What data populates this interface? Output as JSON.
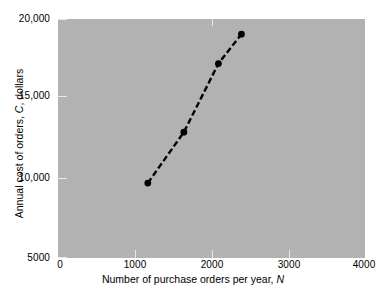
{
  "chart_data": {
    "type": "line",
    "title": "",
    "subtitle": "",
    "xlabel_prefix": "Number of purchase orders per year, ",
    "xlabel_symbol": "N",
    "ylabel_prefix": "Annual cost of orders, ",
    "ylabel_symbol": "C",
    "ylabel_suffix": ", dollars",
    "xlim": [
      0,
      4000
    ],
    "ylim": [
      5000,
      20000
    ],
    "xticks": [
      0,
      1000,
      2000,
      3000,
      4000
    ],
    "xtick_labels": [
      "0",
      "1000",
      "2000",
      "3000",
      "4000"
    ],
    "yticks": [
      5000,
      10000,
      15000,
      20000
    ],
    "ytick_labels": [
      "5000",
      "10,000",
      "15,000",
      "20,000"
    ],
    "grid": false,
    "legend": null,
    "legend_position": "none",
    "plot_background_color": "#b2b2b2",
    "figure_background_color": "#ffffff",
    "series": [
      {
        "name": "Annual cost of orders",
        "line_style": "dashed",
        "line_color": "#000000",
        "marker": "circle",
        "marker_color": "#000000",
        "x": [
          1170,
          1640,
          2090,
          2390
        ],
        "y": [
          9700,
          12900,
          17200,
          19050
        ]
      }
    ]
  },
  "axes": {
    "y": {
      "ticks": [
        {
          "value": 20000,
          "label": "20,000"
        },
        {
          "value": 15000,
          "label": "15,000"
        },
        {
          "value": 10000,
          "label": "10,000"
        },
        {
          "value": 5000,
          "label": "5000"
        }
      ]
    },
    "x": {
      "ticks": [
        {
          "value": 0,
          "label": "0"
        },
        {
          "value": 1000,
          "label": "1000"
        },
        {
          "value": 2000,
          "label": "2000"
        },
        {
          "value": 3000,
          "label": "3000"
        },
        {
          "value": 4000,
          "label": "4000"
        }
      ]
    }
  }
}
